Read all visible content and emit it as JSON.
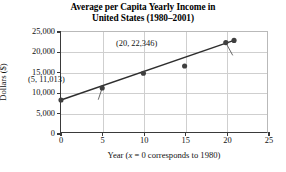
{
  "chart_data": {
    "type": "scatter",
    "title": "Average per Capita Yearly Income in United States (1980–2001)",
    "title_lines": [
      "Average per Capita Yearly Income in",
      "United States (1980–2001)"
    ],
    "xlabel_prefix": "Year (",
    "xlabel_var": "x",
    "xlabel_suffix": " = 0 corresponds to 1980)",
    "xlabel": "Year (x = 0 corresponds to 1980)",
    "ylabel": "Dollars ($)",
    "xlim": [
      0,
      25
    ],
    "ylim": [
      0,
      25000
    ],
    "xticks": [
      0,
      5,
      10,
      15,
      20,
      25
    ],
    "xtick_labels": [
      "0",
      "5",
      "10",
      "15",
      "20",
      "25"
    ],
    "yticks": [
      0,
      5000,
      10000,
      15000,
      20000,
      25000
    ],
    "ytick_labels": [
      "0",
      "5,000",
      "10,000",
      "15,000",
      "20,000",
      "25,000"
    ],
    "grid": true,
    "legend": null,
    "marker_color": "#3f3f3f",
    "line_color": "#2e2e2e",
    "grid_color": "#cfcfcf",
    "axis_color": "#3a3a3a",
    "x": [
      0,
      5,
      10,
      15,
      20,
      21
    ],
    "values": [
      8000,
      11013,
      14700,
      16500,
      22346,
      22900
    ],
    "points": [
      {
        "x": 0,
        "y": 8000
      },
      {
        "x": 5,
        "y": 11013
      },
      {
        "x": 10,
        "y": 14700
      },
      {
        "x": 15,
        "y": 16500
      },
      {
        "x": 20,
        "y": 22346
      },
      {
        "x": 21,
        "y": 22900
      }
    ],
    "trend_line": {
      "x0": 0,
      "y0": 8000,
      "x1": 21,
      "y1": 22900
    },
    "annotations": [
      {
        "text": "(5, 11,013)",
        "point_x": 5,
        "point_y": 11013
      },
      {
        "text": "(20, 22,346)",
        "point_x": 20,
        "point_y": 22346
      }
    ]
  }
}
